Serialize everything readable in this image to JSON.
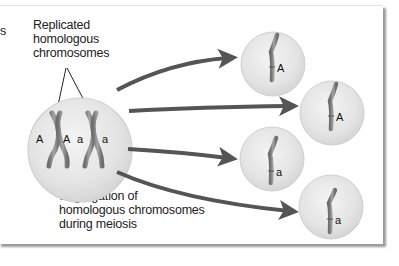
{
  "figure": {
    "left_fragment": "s",
    "label_top": [
      "Replicated",
      "homologous",
      "chromosomes"
    ],
    "label_bottom": [
      "Segregation of",
      "homologous chromosomes",
      "during meiosis"
    ],
    "parent_cell": {
      "alleles": [
        "A",
        "A",
        "a",
        "a"
      ]
    },
    "gametes": [
      {
        "allele": "A"
      },
      {
        "allele": "A"
      },
      {
        "allele": "a"
      },
      {
        "allele": "a"
      }
    ],
    "colors": {
      "cell_fill": "#e6e6e6",
      "cell_edge": "#cfcfcf",
      "arrow": "#555555",
      "chromosome": "#8a8a8a",
      "text": "#222222"
    }
  }
}
